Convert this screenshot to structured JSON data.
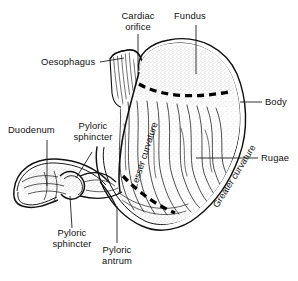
{
  "figure": {
    "background_color": "#ffffff",
    "ink_color": "#000000",
    "stipple_color": "#7a7a7a"
  },
  "labels": {
    "cardiac_orifice": "Cardiac\norifice",
    "fundus": "Fundus",
    "oesophagus": "Oesophagus",
    "body": "Body",
    "rugae": "Rugae",
    "duodenum": "Duodenum",
    "pyloric_sphincter_top": "Pyloric\nsphincter",
    "pyloric_sphincter_bottom": "Pyloric\nsphincter",
    "pyloric_antrum": "Pyloric\nantrum",
    "lesser_curvature": "Lesser curvature",
    "greater_curvature": "Greater curvature"
  }
}
